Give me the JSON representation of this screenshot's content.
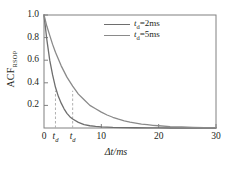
{
  "chart_data": {
    "type": "line",
    "title": "",
    "xlabel": "Δt/ms",
    "ylabel": "ACF",
    "ylabel_sub": "RSOP",
    "xlim": [
      0,
      30
    ],
    "ylim": [
      0,
      1.0
    ],
    "grid": false,
    "legend_position": "top-right",
    "xticks": [
      0,
      10,
      20,
      30
    ],
    "xticklabels": [
      "0",
      "10",
      "20",
      "30"
    ],
    "yticks": [
      0.2,
      0.4,
      0.6,
      0.8,
      1.0
    ],
    "yticklabels": [
      "0.2",
      "0.4",
      "0.6",
      "0.8",
      "1.0"
    ],
    "annotations": [
      {
        "name": "td-marker-2ms",
        "x": 2,
        "label_main": "t",
        "label_sub": "d",
        "style": "dashed-vertical",
        "color": "#b0b0b0"
      },
      {
        "name": "td-marker-5ms",
        "x": 5,
        "label_main": "t",
        "label_sub": "d",
        "style": "dashed-vertical",
        "color": "#b0b0b0"
      }
    ],
    "series": [
      {
        "name": "t_d=2ms",
        "legend_main": "t",
        "legend_sub": "d",
        "legend_rest": "=2ms",
        "color": "#6e6e6e",
        "td": 2,
        "x": [
          0,
          0.5,
          1,
          1.5,
          2,
          2.5,
          3,
          3.5,
          4,
          4.5,
          5,
          6,
          7,
          8,
          9,
          10,
          12,
          14,
          16,
          18,
          20,
          22,
          24,
          26,
          28,
          30
        ],
        "y": [
          1.0,
          0.78,
          0.6,
          0.47,
          0.36,
          0.28,
          0.22,
          0.17,
          0.13,
          0.1,
          0.08,
          0.05,
          0.03,
          0.02,
          0.014,
          0.01,
          0.005,
          0.003,
          0.002,
          0.001,
          0.001,
          0.0,
          0.0,
          0.0,
          0.0,
          0.0
        ]
      },
      {
        "name": "t_d=5ms",
        "legend_main": "t",
        "legend_sub": "d",
        "legend_rest": "=5ms",
        "color": "#8a8a8a",
        "td": 5,
        "x": [
          0,
          0.5,
          1,
          1.5,
          2,
          3,
          4,
          5,
          6,
          7,
          8,
          9,
          10,
          11,
          12,
          13,
          14,
          15,
          16,
          17,
          18,
          19,
          20,
          22,
          24,
          26,
          28,
          30
        ],
        "y": [
          1.0,
          0.9,
          0.82,
          0.74,
          0.67,
          0.55,
          0.45,
          0.37,
          0.3,
          0.25,
          0.2,
          0.17,
          0.14,
          0.115,
          0.095,
          0.078,
          0.064,
          0.052,
          0.043,
          0.035,
          0.029,
          0.024,
          0.02,
          0.013,
          0.009,
          0.006,
          0.004,
          0.003
        ]
      }
    ]
  },
  "axes": {
    "frame_color": "#808080"
  }
}
